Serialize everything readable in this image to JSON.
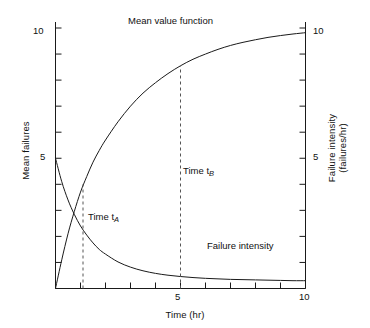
{
  "chart_data": {
    "type": "line",
    "title": "",
    "xlabel": "Time (hr)",
    "ylabel": "Mean failures",
    "y2label_line1": "Failure intensity",
    "y2label_line2": "(failures/hr)",
    "xlim": [
      0,
      10
    ],
    "ylim": [
      0,
      10
    ],
    "y2lim": [
      0,
      10
    ],
    "grid": false,
    "legend_position": "inline-annotations",
    "x_ticks": [
      0,
      1,
      2,
      3,
      4,
      5,
      6,
      7,
      8,
      9,
      10
    ],
    "x_tick_labels": [
      "",
      "",
      "",
      "",
      "",
      "5",
      "",
      "",
      "",
      "",
      "10"
    ],
    "y_ticks": [
      0,
      1,
      2,
      3,
      4,
      5,
      6,
      7,
      8,
      9,
      10
    ],
    "y_tick_labels": [
      "",
      "",
      "",
      "",
      "",
      "5",
      "",
      "",
      "",
      "",
      "10"
    ],
    "y2_ticks": [
      0,
      1,
      2,
      3,
      4,
      5,
      6,
      7,
      8,
      9,
      10
    ],
    "y2_tick_labels": [
      "",
      "",
      "",
      "",
      "",
      "5",
      "",
      "",
      "",
      "",
      "10"
    ],
    "series": [
      {
        "name": "Mean value function",
        "axis": "left",
        "style": "solid",
        "x": [
          0,
          0.25,
          0.5,
          0.75,
          1,
          1.25,
          1.5,
          1.75,
          2,
          2.5,
          3,
          3.5,
          4,
          4.5,
          5,
          5.5,
          6,
          6.5,
          7,
          7.5,
          8,
          8.5,
          9,
          9.5,
          10
        ],
        "values": [
          0,
          1.1,
          2.1,
          2.95,
          3.7,
          4.3,
          4.85,
          5.3,
          5.7,
          6.4,
          7.0,
          7.5,
          7.9,
          8.25,
          8.55,
          8.8,
          9.0,
          9.18,
          9.33,
          9.45,
          9.55,
          9.64,
          9.71,
          9.77,
          9.82
        ]
      },
      {
        "name": "Failure intensity",
        "axis": "right",
        "style": "solid",
        "x": [
          0,
          0.25,
          0.5,
          0.75,
          1,
          1.25,
          1.5,
          1.75,
          2,
          2.5,
          3,
          3.5,
          4,
          4.5,
          5,
          5.5,
          6,
          6.5,
          7,
          7.5,
          8,
          8.5,
          9,
          9.5,
          10
        ],
        "values": [
          5.0,
          4.1,
          3.4,
          2.85,
          2.4,
          2.05,
          1.75,
          1.5,
          1.32,
          1.02,
          0.82,
          0.68,
          0.58,
          0.51,
          0.46,
          0.42,
          0.39,
          0.37,
          0.35,
          0.34,
          0.33,
          0.32,
          0.31,
          0.3,
          0.3
        ]
      }
    ],
    "annotations": [
      {
        "name": "Time t_A",
        "label_prefix": "Time t",
        "label_sub": "A",
        "x": 1.1,
        "y_from": 0,
        "y_to": 4.0,
        "style": "dashed"
      },
      {
        "name": "Time t_B",
        "label_prefix": "Time t",
        "label_sub": "B",
        "x": 5.0,
        "y_from": 0,
        "y_to": 8.55,
        "style": "dashed"
      }
    ],
    "curve_labels": [
      {
        "text": "Mean value function",
        "x": 4.4,
        "y": 10.5
      },
      {
        "text": "Failure intensity",
        "x": 7.5,
        "y": 1.45
      }
    ],
    "colors": {
      "axis": "#1a1a1a",
      "curve": "#1a1a1a",
      "dashed": "#555555",
      "background": "#ffffff"
    }
  },
  "labels": {
    "title_mean_value": "Mean value function",
    "label_failure_intensity": "Failure intensity",
    "time_a_prefix": "Time t",
    "time_a_sub": "A",
    "time_b_prefix": "Time t",
    "time_b_sub": "B",
    "x_axis_title": "Time (hr)",
    "y_left_title": "Mean failures",
    "y_right_title_line1": "Failure intensity",
    "y_right_title_line2": "(failures/hr)",
    "y_left_tick_10": "10",
    "y_left_tick_5": "5",
    "y_right_tick_10": "10",
    "y_right_tick_5": "5",
    "x_tick_5": "5",
    "x_tick_10": "10"
  }
}
